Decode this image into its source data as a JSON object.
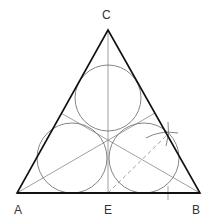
{
  "diagram": {
    "labels": {
      "A": "A",
      "B": "B",
      "C": "C",
      "E": "E"
    },
    "colors": {
      "triangle": "#111111",
      "construction": "#777777",
      "circle": "#666666",
      "label": "#333333"
    },
    "elements": [
      "triangle ABC",
      "median from C to E",
      "angle bisectors from A and B",
      "three inscribed circles",
      "dashed construction line from E",
      "arc intersection mark on side BC",
      "tick mark on AB"
    ]
  }
}
